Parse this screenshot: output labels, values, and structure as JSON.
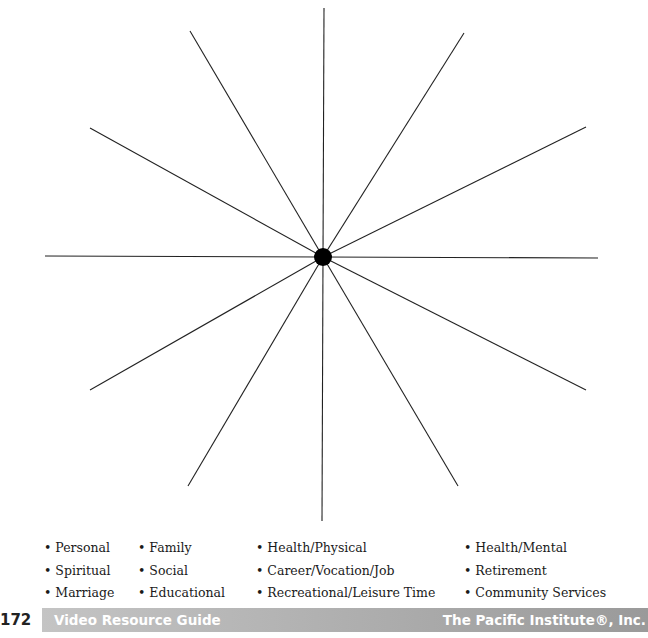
{
  "diagram": {
    "type": "spoke-wheel",
    "center": {
      "x": 323,
      "y": 257,
      "radius": 9
    },
    "spoke_count": 12,
    "line_color": "#222222"
  },
  "categories": {
    "col1": [
      "Personal",
      "Spiritual",
      "Marriage"
    ],
    "col2": [
      "Family",
      "Social",
      "Educational"
    ],
    "col3": [
      "Health/Physical",
      "Career/Vocation/Job",
      "Recreational/Leisure Time"
    ],
    "col4": [
      "Health/Mental",
      "Retirement",
      "Community Services"
    ],
    "bullet": "•"
  },
  "footer": {
    "page_number": "172",
    "left_title": "Video Resource Guide",
    "right_title": "The Pacific Institute®, Inc."
  }
}
